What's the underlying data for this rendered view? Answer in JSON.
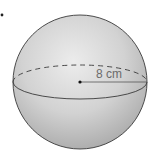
{
  "figure": {
    "type": "sphere",
    "radius_label": "8 cm",
    "bullet_marker": "•",
    "colors": {
      "background": "#ffffff",
      "sphere_light": "#e6e6e6",
      "sphere_dark": "#a9a9a9",
      "outline": "#3a3a3a",
      "label": "#6b6b6b"
    }
  }
}
